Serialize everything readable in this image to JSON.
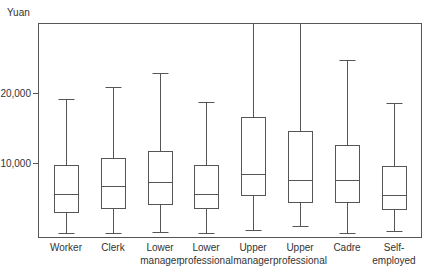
{
  "chart_data": {
    "type": "boxplot",
    "title": "",
    "xlabel": "",
    "ylabel": "Yuan",
    "ylim": [
      0,
      30000
    ],
    "yticks": [
      {
        "value": 10000,
        "label": "10,000"
      },
      {
        "value": 20000,
        "label": "20,000"
      }
    ],
    "grid": false,
    "legend": null,
    "categories": [
      [
        "Worker"
      ],
      [
        "Clerk"
      ],
      [
        "Lower",
        "manager"
      ],
      [
        "Lower",
        "professional"
      ],
      [
        "Upper",
        "manager"
      ],
      [
        "Upper",
        "professional"
      ],
      [
        "Cadre"
      ],
      [
        "Self-",
        "employed"
      ]
    ],
    "category_names": [
      "Worker",
      "Clerk",
      "Lower manager",
      "Lower professional",
      "Upper manager",
      "Upper professional",
      "Cadre",
      "Self-employed"
    ],
    "series": [
      {
        "name": "Worker",
        "min": 0,
        "q1": 3000,
        "median": 5600,
        "q3": 9700,
        "max": 19100
      },
      {
        "name": "Clerk",
        "min": 0,
        "q1": 3600,
        "median": 6700,
        "q3": 10700,
        "max": 20900
      },
      {
        "name": "Lower manager",
        "min": 200,
        "q1": 4100,
        "median": 7300,
        "q3": 11700,
        "max": 22900
      },
      {
        "name": "Lower professional",
        "min": 0,
        "q1": 3600,
        "median": 5600,
        "q3": 9700,
        "max": 18700
      },
      {
        "name": "Upper manager",
        "min": 500,
        "q1": 5400,
        "median": 8400,
        "q3": 16600,
        "max": 30000
      },
      {
        "name": "Upper professional",
        "min": 1000,
        "q1": 4400,
        "median": 7600,
        "q3": 14600,
        "max": 30000
      },
      {
        "name": "Cadre",
        "min": 0,
        "q1": 4400,
        "median": 7600,
        "q3": 12600,
        "max": 24700
      },
      {
        "name": "Self-employed",
        "min": 300,
        "q1": 3400,
        "median": 5400,
        "q3": 9600,
        "max": 18600
      }
    ]
  },
  "layout": {
    "plot_left": 38,
    "plot_right": 421,
    "plot_top": 23,
    "plot_bottom": 237,
    "zero_y": 233,
    "px_per_unit": 0.007,
    "box_half_width": 12,
    "cap_half_width": 8,
    "centers": [
      66,
      113,
      160,
      206,
      253,
      300,
      347,
      394
    ]
  }
}
